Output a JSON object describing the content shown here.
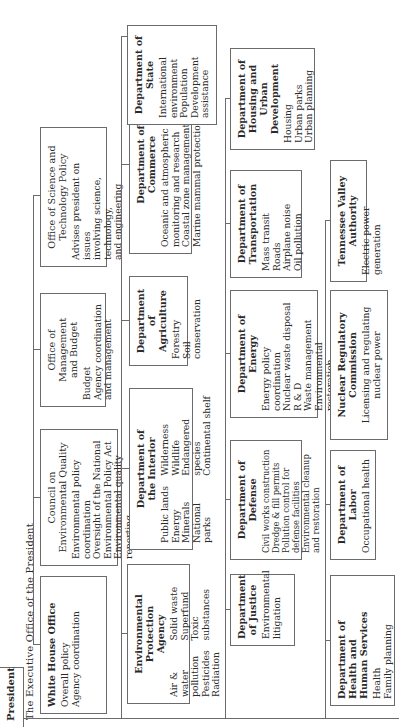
{
  "president": "President",
  "executive_office": "The Executive Office of the President",
  "executive_units": [
    {
      "title": "White House Office",
      "items": "Overall policy\nAgency coordination"
    },
    {
      "title": "Council on\nEnvironmental Quality",
      "items": "Environmental policy coordination\nOversight of the National\n   Environmental Policy Act\nEnvironmental quality reporting"
    },
    {
      "title": "Office of Management\nand Budget",
      "items": "Budget\nAgency coordination\n   and management"
    },
    {
      "title": "Office of Science and\nTechnology Policy",
      "items": "Advises president on issues\n   involving science, technology,\n   and engineering"
    }
  ],
  "row1": [
    {
      "title": "Environmental Protection\nAgency",
      "col1": "Air & water\n   pollution\nPesticides\nRadiation",
      "col2": "Solid waste\nSuperfund\nToxic substances"
    },
    {
      "title": "Department of\nthe Interior",
      "col1": "Public lands\nEnergy\nMinerals\nNational parks",
      "col2": "Wilderness\nWildlife\nEndangered species\nContinental shelf"
    },
    {
      "title": "Department of\nAgriculture",
      "items": "Forestry\nSoil conservation"
    },
    {
      "title": "Department of\nCommerce",
      "items": "Oceanic and atmospheric\n   monitoring and research\nCoastal zone management\nMarine mammal protection"
    },
    {
      "title": "Department of\nState",
      "items": "International\n   environment\nPopulation\nDevelopment\n   assistance"
    }
  ],
  "row2": [
    {
      "title": "Department\nof Justice",
      "items": "Environmental\n   litigation"
    },
    {
      "title": "Department of Defense",
      "items": "Civil works construction\nDredge & fill permits\nPollution control for defense facilities\nEnvironmental cleanup and restoration"
    },
    {
      "title": "Department of Energy",
      "items": "Energy policy coordination\nNuclear waste disposal\nR & D\nWaste management\nEnvironmental restoration"
    },
    {
      "title": "Department of\nTransportation",
      "items": "Mass transit\nRoads\nAirplane noise\nOil pollution"
    },
    {
      "title": "Department of\nHousing and\nUrban Development",
      "items": "Housing\nUrban parks\nUrban planning"
    }
  ],
  "row3": [
    {
      "title": "Department of\nHealth and\nHuman Services",
      "items": "Health\nFamily planning"
    },
    {
      "title": "Department of Labor",
      "items": "Occupational health"
    },
    {
      "title": "Nuclear Regulatory\nCommission",
      "items": "Licensing and regulating\nnuclear power"
    },
    {
      "title": "Tennessee Valley Authority",
      "items": "Electric power generation"
    }
  ]
}
